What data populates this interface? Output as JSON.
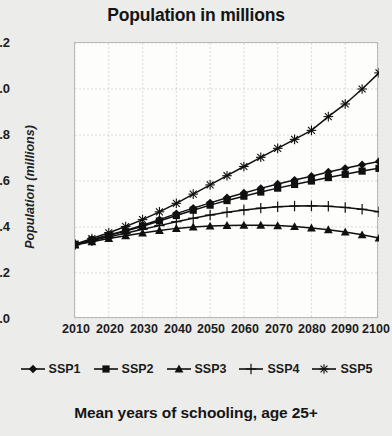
{
  "chart_data": {
    "type": "line",
    "title": "Population in millions",
    "caption": "Mean years of schooling, age 25+",
    "xlabel": "",
    "ylabel": "Population (millions)",
    "xlim": [
      2010,
      2100
    ],
    "ylim": [
      0.0,
      1.2
    ],
    "grid": true,
    "legend_position": "bottom",
    "xticks": [
      "2010",
      "2020",
      "2030",
      "2040",
      "2050",
      "2060",
      "2070",
      "2080",
      "2090",
      "2100"
    ],
    "yticks": [
      "0.0",
      "0.2",
      "0.4",
      "0.6",
      "0.8",
      "1.0",
      "1.2"
    ],
    "x": [
      2010,
      2015,
      2020,
      2025,
      2030,
      2035,
      2040,
      2045,
      2050,
      2055,
      2060,
      2065,
      2070,
      2075,
      2080,
      2085,
      2090,
      2095,
      2100
    ],
    "series": [
      {
        "name": "SSP1",
        "marker": "diamond",
        "color": "#101010",
        "values": [
          0.325,
          0.345,
          0.365,
          0.385,
          0.408,
          0.432,
          0.458,
          0.482,
          0.505,
          0.527,
          0.548,
          0.568,
          0.587,
          0.604,
          0.621,
          0.639,
          0.655,
          0.671,
          0.685
        ]
      },
      {
        "name": "SSP2",
        "marker": "square",
        "color": "#101010",
        "values": [
          0.325,
          0.344,
          0.363,
          0.382,
          0.403,
          0.426,
          0.45,
          0.473,
          0.495,
          0.515,
          0.534,
          0.552,
          0.569,
          0.585,
          0.6,
          0.615,
          0.629,
          0.643,
          0.655
        ]
      },
      {
        "name": "SSP3",
        "marker": "triangle",
        "color": "#101010",
        "values": [
          0.322,
          0.336,
          0.35,
          0.362,
          0.374,
          0.385,
          0.394,
          0.4,
          0.404,
          0.407,
          0.408,
          0.408,
          0.406,
          0.402,
          0.396,
          0.388,
          0.378,
          0.366,
          0.352
        ]
      },
      {
        "name": "SSP4",
        "marker": "plus",
        "color": "#101010",
        "values": [
          0.323,
          0.34,
          0.357,
          0.373,
          0.39,
          0.406,
          0.423,
          0.438,
          0.452,
          0.464,
          0.474,
          0.482,
          0.488,
          0.491,
          0.492,
          0.49,
          0.485,
          0.477,
          0.466
        ]
      },
      {
        "name": "SSP5",
        "marker": "asterisk",
        "color": "#101010",
        "values": [
          0.325,
          0.35,
          0.375,
          0.402,
          0.432,
          0.466,
          0.503,
          0.543,
          0.583,
          0.623,
          0.663,
          0.703,
          0.742,
          0.781,
          0.82,
          0.88,
          0.935,
          1.0,
          1.07
        ]
      }
    ]
  },
  "legend": {
    "items": [
      {
        "label": "SSP1",
        "icon": "diamond-marker-icon"
      },
      {
        "label": "SSP2",
        "icon": "square-marker-icon"
      },
      {
        "label": "SSP3",
        "icon": "triangle-marker-icon"
      },
      {
        "label": "SSP4",
        "icon": "plus-marker-icon"
      },
      {
        "label": "SSP5",
        "icon": "asterisk-marker-icon"
      }
    ]
  }
}
